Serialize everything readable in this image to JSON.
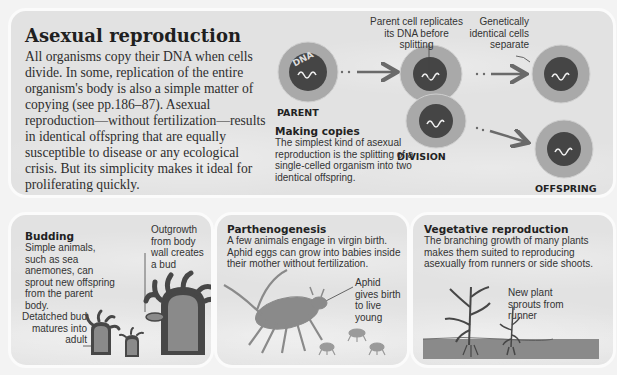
{
  "main": {
    "title": "Asexual reproduction",
    "body": "All organisms copy their DNA when cells divide. In some, replication of the entire organism's body is also a simple matter of copying (see pp.186–87). Asexual reproduction—without fertilization—results in identical offspring that are equally susceptible to disease or any ecological crisis. But its simplicity makes it ideal for proliferating quickly.",
    "diagram": {
      "dna_label": "DNA",
      "parent_label": "PARENT",
      "division_label": "DIVISION",
      "offspring_label": "OFFSPRING",
      "callout_replicates": "Parent cell replicates its DNA before splitting",
      "callout_separate": "Genetically identical cells separate",
      "making_copies_title": "Making copies",
      "making_copies_body": "The simplest kind of asexual reproduction is the splitting of a single-celled organism into two identical offspring."
    }
  },
  "budding": {
    "title": "Budding",
    "body": "Simple animals, such as sea anemones, can sprout new offspring from the parent body.",
    "callout_outgrowth": "Outgrowth from body wall creates a bud",
    "callout_detached": "Detatched bud matures into adult"
  },
  "parthenogenesis": {
    "title": "Parthenogenesis",
    "body": "A few animals engage in virgin birth. Aphid eggs can grow into babies inside their mother without fertilization.",
    "callout_aphid": "Aphid gives birth to live young"
  },
  "vegetative": {
    "title": "Vegetative reproduction",
    "body": "The branching growth of many plants makes them suited to reproducing asexually from runners or side shoots.",
    "callout_sprouts": "New plant sprouts from runner"
  },
  "colors": {
    "panel_bg": "#e2e2e2",
    "panel_border": "#fbfbfb",
    "cell_outer": "#a9a9a9",
    "cell_nucleus": "#454545",
    "arrow": "#6a6a6a",
    "illustration": "#8a8a8a",
    "illustration_dark": "#474747"
  }
}
